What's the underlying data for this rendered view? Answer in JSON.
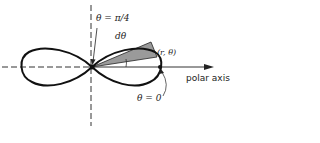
{
  "figure": {
    "labels": {
      "theta_pi4": "θ = π/4",
      "dtheta": "dθ",
      "point": "(r, θ)",
      "polar_axis": "polar axis",
      "theta_zero": "θ = 0"
    },
    "colors": {
      "curve": "#111111",
      "wedge": "#9a9a9a",
      "axis": "#333333"
    }
  }
}
